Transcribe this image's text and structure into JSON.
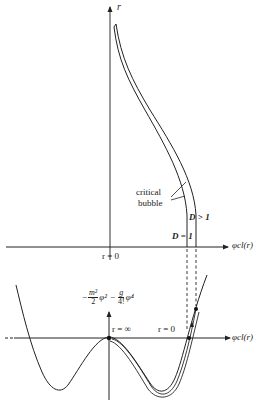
{
  "upper_plot": {
    "y_axis_label": "r",
    "x_axis_label": "φcl(r)",
    "origin_label": "r = 0",
    "annotation": "critical bubble",
    "annotation_line1": "critical",
    "annotation_line2": "bubble",
    "curve_labels": {
      "inner": "D = 1",
      "outer": "D > 1"
    }
  },
  "lower_plot": {
    "potential_label": {
      "minus": "−",
      "frac1_num": "m²",
      "frac1_den": "2",
      "phi2": "φ²",
      "minus2": "−",
      "frac2_num": "g",
      "frac2_den": "4!",
      "phi4": "φ⁴"
    },
    "x_axis_label": "φcl(r)",
    "marker_labels": {
      "r_inf": "r = ∞",
      "r_zero": "r = 0"
    }
  },
  "colors": {
    "ink": "#222222",
    "background": "#ffffff"
  }
}
